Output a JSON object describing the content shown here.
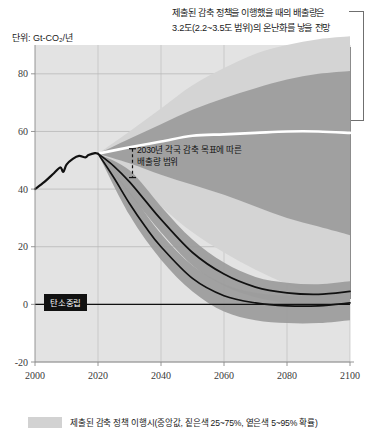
{
  "unit_label": "단위: Gt-CO₂/년",
  "annotations": {
    "top": {
      "line1": "제출된 감축 정책을 이행했을 때의 배출량은",
      "line2": "3.2도(2.2~3.5도 범위)의 온난화를 낳을 전망"
    },
    "in_chart_2030": {
      "line1": "2030년 각국 감축 목표에 따른",
      "line2": "배출량 범위"
    },
    "carbon_neutral_badge": "탄소중립"
  },
  "legend": {
    "swatch_color": "#d2d2d2",
    "label": "제출된 감축 정책 이행시(중앙값, 짙은색 25~75%, 옅은색 5~95% 확률)"
  },
  "colors": {
    "band_light": "#d4d4d4",
    "band_dark": "#9d9d9d",
    "median_line": "#ffffff",
    "historical_line": "#111111",
    "pathway_line": "#111111",
    "plot_background": "#e3e3e3",
    "grid": "#b9b9b9",
    "axis": "#8a8a8a"
  },
  "chart_data": {
    "type": "area",
    "title": "",
    "subtitle": "",
    "xlabel": "",
    "ylabel": "Gt-CO₂/년",
    "xlim": [
      2000,
      2100
    ],
    "ylim": [
      -20,
      90
    ],
    "xticks": [
      2000,
      2020,
      2040,
      2060,
      2080,
      2100
    ],
    "yticks": [
      -20,
      0,
      20,
      40,
      60,
      80
    ],
    "grid": true,
    "legend_position": "bottom-left",
    "zero_line": 0,
    "branch_year": 2020,
    "series": [
      {
        "name": "역사적 배출량 (historical)",
        "type": "line",
        "color": "#111111",
        "x": [
          2000,
          2003,
          2006,
          2008,
          2009,
          2010,
          2012,
          2014,
          2016,
          2017,
          2019,
          2020
        ],
        "values": [
          40.0,
          42.5,
          45.5,
          47.5,
          46.0,
          48.5,
          50.5,
          51.5,
          51.0,
          51.8,
          52.5,
          52.3
        ]
      },
      {
        "name": "제출된 감축 정책 이행시 (중앙값)",
        "type": "line",
        "color": "#ffffff",
        "x": [
          2020,
          2030,
          2040,
          2050,
          2060,
          2070,
          2080,
          2090,
          2100
        ],
        "values": [
          52.3,
          54.5,
          56.5,
          58.5,
          59.0,
          59.5,
          60.0,
          60.0,
          59.5
        ]
      },
      {
        "name": "제출된 감축 정책 이행시 (5~95% 확률, 옅은색)",
        "type": "band",
        "color": "#d4d4d4",
        "x": [
          2020,
          2030,
          2040,
          2050,
          2060,
          2070,
          2080,
          2090,
          2100
        ],
        "lower": [
          52.3,
          44.0,
          34.0,
          25.0,
          18.0,
          12.0,
          7.0,
          3.0,
          0.0
        ],
        "upper": [
          52.3,
          60.0,
          68.0,
          76.0,
          82.0,
          87.0,
          90.0,
          92.0,
          93.0
        ]
      },
      {
        "name": "제출된 감축 정책 이행시 (25~75% 확률, 짙은색)",
        "type": "band",
        "color": "#9d9d9d",
        "x": [
          2020,
          2030,
          2040,
          2050,
          2060,
          2070,
          2080,
          2090,
          2100
        ],
        "lower": [
          52.3,
          49.0,
          45.0,
          41.5,
          38.0,
          34.0,
          30.0,
          27.0,
          24.0
        ],
        "upper": [
          52.3,
          57.5,
          62.5,
          67.5,
          71.5,
          75.0,
          78.0,
          80.0,
          81.0
        ]
      },
      {
        "name": "2도 경로 (중앙 경로, 짙은선 위)",
        "type": "line",
        "color": "#111111",
        "x": [
          2020,
          2025,
          2030,
          2035,
          2040,
          2050,
          2060,
          2070,
          2080,
          2090,
          2100
        ],
        "values": [
          52.3,
          48.0,
          42.5,
          36.0,
          29.5,
          18.0,
          10.5,
          6.0,
          4.0,
          3.5,
          4.5
        ]
      },
      {
        "name": "1.5도 경로 (중앙 경로, 짙은선 아래)",
        "type": "line",
        "color": "#111111",
        "x": [
          2020,
          2025,
          2030,
          2035,
          2040,
          2050,
          2060,
          2070,
          2080,
          2090,
          2100
        ],
        "values": [
          52.3,
          44.0,
          35.0,
          27.0,
          20.0,
          9.0,
          3.0,
          0.5,
          -0.5,
          -0.5,
          0.5
        ]
      },
      {
        "name": "2도 경로 불확실성 밴드",
        "type": "band",
        "color": "#9d9d9d",
        "x": [
          2020,
          2030,
          2040,
          2050,
          2060,
          2070,
          2080,
          2090,
          2100
        ],
        "lower": [
          52.3,
          38.5,
          25.0,
          13.5,
          6.5,
          2.5,
          0.5,
          0.0,
          1.0
        ],
        "upper": [
          52.3,
          46.5,
          34.0,
          22.5,
          14.5,
          9.5,
          7.5,
          7.0,
          8.0
        ]
      },
      {
        "name": "1.5도 경로 불확실성 밴드",
        "type": "band",
        "color": "#9d9d9d",
        "x": [
          2020,
          2030,
          2040,
          2050,
          2060,
          2070,
          2080,
          2090,
          2100
        ],
        "lower": [
          52.3,
          31.0,
          15.5,
          4.5,
          -2.5,
          -5.5,
          -6.5,
          -6.5,
          -5.5
        ],
        "upper": [
          52.3,
          39.0,
          24.5,
          13.5,
          7.0,
          4.0,
          3.0,
          3.0,
          4.0
        ]
      }
    ],
    "annotation_range_2030": {
      "year": 2030,
      "low": 44.0,
      "high": 54.0,
      "label": "2030년 각국 감축 목표에 따른 배출량 범위"
    }
  }
}
